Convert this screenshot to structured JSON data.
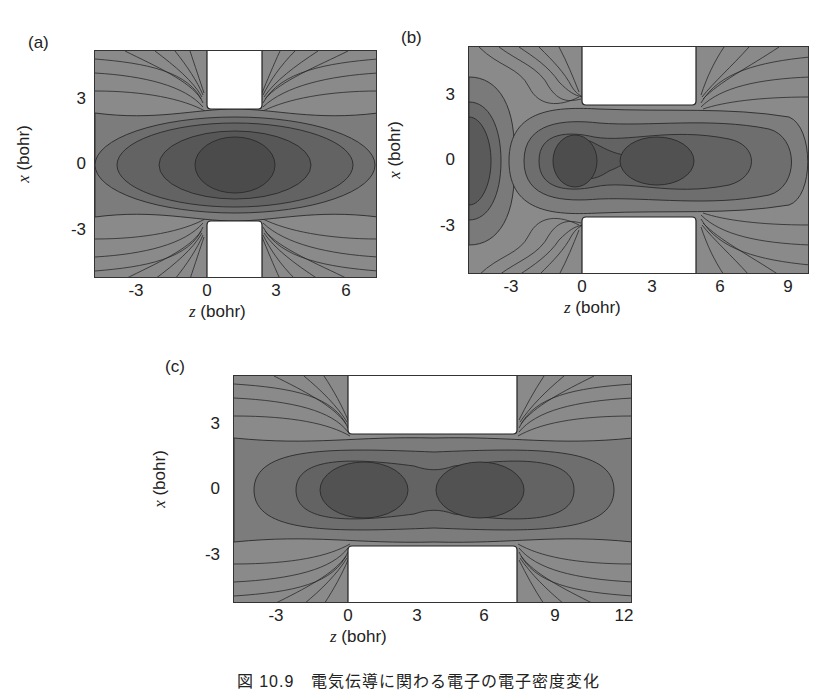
{
  "figure": {
    "caption": "図 10.9　電気伝導に関わる電子の電子密度変化"
  },
  "chart_data": [
    {
      "type": "heatmap",
      "subtype": "contour",
      "panel": "(a)",
      "xlabel_var": "z",
      "xlabel_unit": "(bohr)",
      "ylabel_var": "x",
      "ylabel_unit": "(bohr)",
      "xticks": [
        "-3",
        "0",
        "3",
        "6"
      ],
      "yticks": [
        "3",
        "0",
        "-3"
      ],
      "xlim": [
        -4.8,
        7.3
      ],
      "ylim": [
        -5.2,
        5.2
      ],
      "electrode_gap_z": [
        0,
        2.2
      ],
      "electrode_inner_x": 2.5,
      "density_maxima_z": [
        1.0
      ],
      "annotation": "single density lobe centered between electrodes"
    },
    {
      "type": "heatmap",
      "subtype": "contour",
      "panel": "(b)",
      "xlabel_var": "z",
      "xlabel_unit": "(bohr)",
      "ylabel_var": "x",
      "ylabel_unit": "(bohr)",
      "xticks": [
        "-3",
        "0",
        "3",
        "6",
        "9"
      ],
      "yticks": [
        "3",
        "0",
        "-3"
      ],
      "xlim": [
        -4.9,
        9.8
      ],
      "ylim": [
        -5.2,
        5.2
      ],
      "electrode_gap_z": [
        0,
        4.7
      ],
      "electrode_inner_x": 2.5,
      "density_maxima_z": [
        -4.3,
        -1.0,
        3.6
      ],
      "annotation": "asymmetric density with lobes at z≈-1 and z≈3.6, extra lobe near z≈-4.3"
    },
    {
      "type": "heatmap",
      "subtype": "contour",
      "panel": "(c)",
      "xlabel_var": "z",
      "xlabel_unit": "(bohr)",
      "ylabel_var": "x",
      "ylabel_unit": "(bohr)",
      "xticks": [
        "-3",
        "0",
        "3",
        "6",
        "9",
        "12"
      ],
      "yticks": [
        "3",
        "0",
        "-3"
      ],
      "xlim": [
        -4.9,
        12.4
      ],
      "ylim": [
        -5.2,
        5.2
      ],
      "electrode_gap_z": [
        0,
        7.2
      ],
      "electrode_inner_x": 2.5,
      "density_maxima_z": [
        1.0,
        6.0
      ],
      "annotation": "symmetric double-lobe density"
    }
  ],
  "colors": {
    "core": "#4b4b4b",
    "ring1": "#575757",
    "ring2": "#636363",
    "ring3": "#6e6e6e",
    "outer": "#7d7d7d",
    "edge": "#8c8c8c",
    "contour_line": "#2a2a2a",
    "electrode": "#ffffff"
  }
}
